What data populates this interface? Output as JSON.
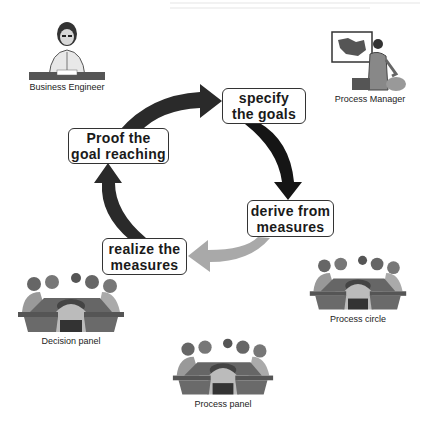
{
  "diagram": {
    "type": "cycle",
    "steps": [
      {
        "id": "specify",
        "line1": "specify",
        "line2": "the goals"
      },
      {
        "id": "derive",
        "line1": "derive from",
        "line2": "measures"
      },
      {
        "id": "realize",
        "line1": "realize the",
        "line2": "measures"
      },
      {
        "id": "proof",
        "line1": "Proof the",
        "line2": "goal reaching"
      }
    ],
    "arrows": [
      {
        "from": "proof",
        "to": "specify",
        "color": "#2a2a2a"
      },
      {
        "from": "specify",
        "to": "derive",
        "color": "#1a1a1a"
      },
      {
        "from": "derive",
        "to": "realize",
        "color": "#a8a8a8"
      },
      {
        "from": "realize",
        "to": "proof",
        "color": "#2a2a2a"
      }
    ],
    "actors": [
      {
        "id": "business-engineer",
        "label": "Business Engineer"
      },
      {
        "id": "process-manager",
        "label": "Process Manager"
      },
      {
        "id": "decision-panel",
        "label": "Decision panel"
      },
      {
        "id": "process-circle",
        "label": "Process circle"
      },
      {
        "id": "process-panel",
        "label": "Process panel"
      }
    ]
  }
}
